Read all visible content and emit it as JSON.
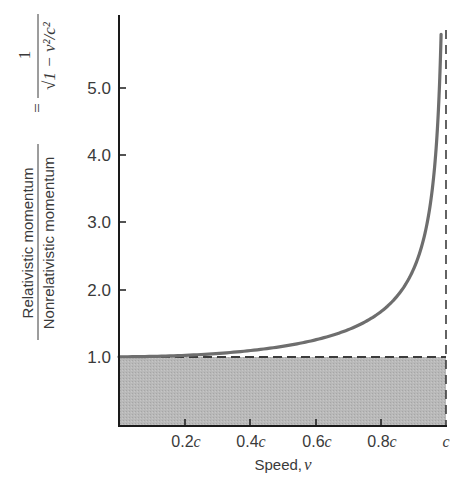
{
  "chart_data": {
    "type": "line",
    "title": "",
    "xlabel": "Speed, v",
    "xlabel_text": "Speed,",
    "xlabel_var": "v",
    "ylabel": {
      "numerator": "Relativistic momentum",
      "denominator": "Nonrelativistic momentum",
      "equals": "=",
      "formula_numerator": "1",
      "formula_denominator": "√1 − v²/c²"
    },
    "x_ticks": [
      {
        "value": 0.2,
        "label": "0.2",
        "suffix": "c"
      },
      {
        "value": 0.4,
        "label": "0.4",
        "suffix": "c"
      },
      {
        "value": 0.6,
        "label": "0.6",
        "suffix": "c"
      },
      {
        "value": 0.8,
        "label": "0.8",
        "suffix": "c"
      },
      {
        "value": 1.0,
        "label": "",
        "suffix": "c"
      }
    ],
    "y_ticks": [
      {
        "value": 1.0,
        "label": "1.0"
      },
      {
        "value": 2.0,
        "label": "2.0"
      },
      {
        "value": 3.0,
        "label": "3.0"
      },
      {
        "value": 4.0,
        "label": "4.0"
      },
      {
        "value": 5.0,
        "label": "5.0"
      }
    ],
    "xlim": [
      0,
      1.0
    ],
    "ylim": [
      0,
      6.0
    ],
    "grid": false,
    "series": [
      {
        "name": "1/sqrt(1 - v^2/c^2)",
        "x": [
          0.0,
          0.1,
          0.2,
          0.3,
          0.4,
          0.5,
          0.6,
          0.7,
          0.8,
          0.85,
          0.9,
          0.93,
          0.95,
          0.97,
          0.98,
          0.985
        ],
        "values": [
          1.0,
          1.005,
          1.021,
          1.048,
          1.091,
          1.155,
          1.25,
          1.4,
          1.667,
          1.898,
          2.294,
          2.72,
          3.203,
          4.113,
          5.025,
          5.81
        ],
        "color": "#6e6e6e"
      }
    ],
    "annotations": [
      {
        "type": "dashed-hline",
        "y": 1.0,
        "label": "Nonrelativistic limit"
      },
      {
        "type": "dashed-vline",
        "x": 1.0,
        "label": "speed of light c"
      },
      {
        "type": "shaded-region",
        "y_range": [
          0,
          1.0
        ],
        "color": "#b4b4b4"
      }
    ]
  },
  "colors": {
    "curve": "#6e6e6e",
    "axis": "#1a1a1a",
    "shade": "#b8b8b8",
    "dash": "#3c3c3c",
    "text": "#3a3a3a"
  }
}
